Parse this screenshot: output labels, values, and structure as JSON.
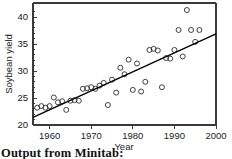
{
  "caption": {
    "text": "Output from Minitab:"
  },
  "chart_data": {
    "type": "scatter",
    "title": "",
    "xlabel": "Year",
    "ylabel": "Soybean yield",
    "xlim": [
      1956,
      2000
    ],
    "ylim": [
      20,
      42.6
    ],
    "xticks": [
      1960,
      1970,
      1980,
      1990,
      2000
    ],
    "yticks": [
      20,
      25,
      30,
      35,
      40
    ],
    "grid": false,
    "legend": null,
    "marker": "open-circle",
    "x": [
      1957,
      1958,
      1959,
      1960,
      1961,
      1962,
      1963,
      1964,
      1965,
      1966,
      1967,
      1968,
      1969,
      1970,
      1971,
      1972,
      1973,
      1974,
      1975,
      1976,
      1977,
      1978,
      1979,
      1980,
      1981,
      1982,
      1983,
      1984,
      1985,
      1986,
      1987,
      1988,
      1989,
      1990,
      1991,
      1992,
      1993,
      1994,
      1995,
      1996
    ],
    "y": [
      23.2,
      23.5,
      23.2,
      23.5,
      25.1,
      24.2,
      24.4,
      22.8,
      24.5,
      24.6,
      24.5,
      26.7,
      26.8,
      27.0,
      26.7,
      27.3,
      27.8,
      23.7,
      28.4,
      26.0,
      30.6,
      29.4,
      32.1,
      26.5,
      31.4,
      26.2,
      28.0,
      33.9,
      34.1,
      33.8,
      27.0,
      32.4,
      32.3,
      33.9,
      37.6,
      32.7,
      41.3,
      37.6,
      35.4,
      37.6
    ],
    "fit_line": {
      "label": "least-squares regression line",
      "x": [
        1956,
        2000
      ],
      "y": [
        21.4,
        36.9
      ]
    }
  }
}
